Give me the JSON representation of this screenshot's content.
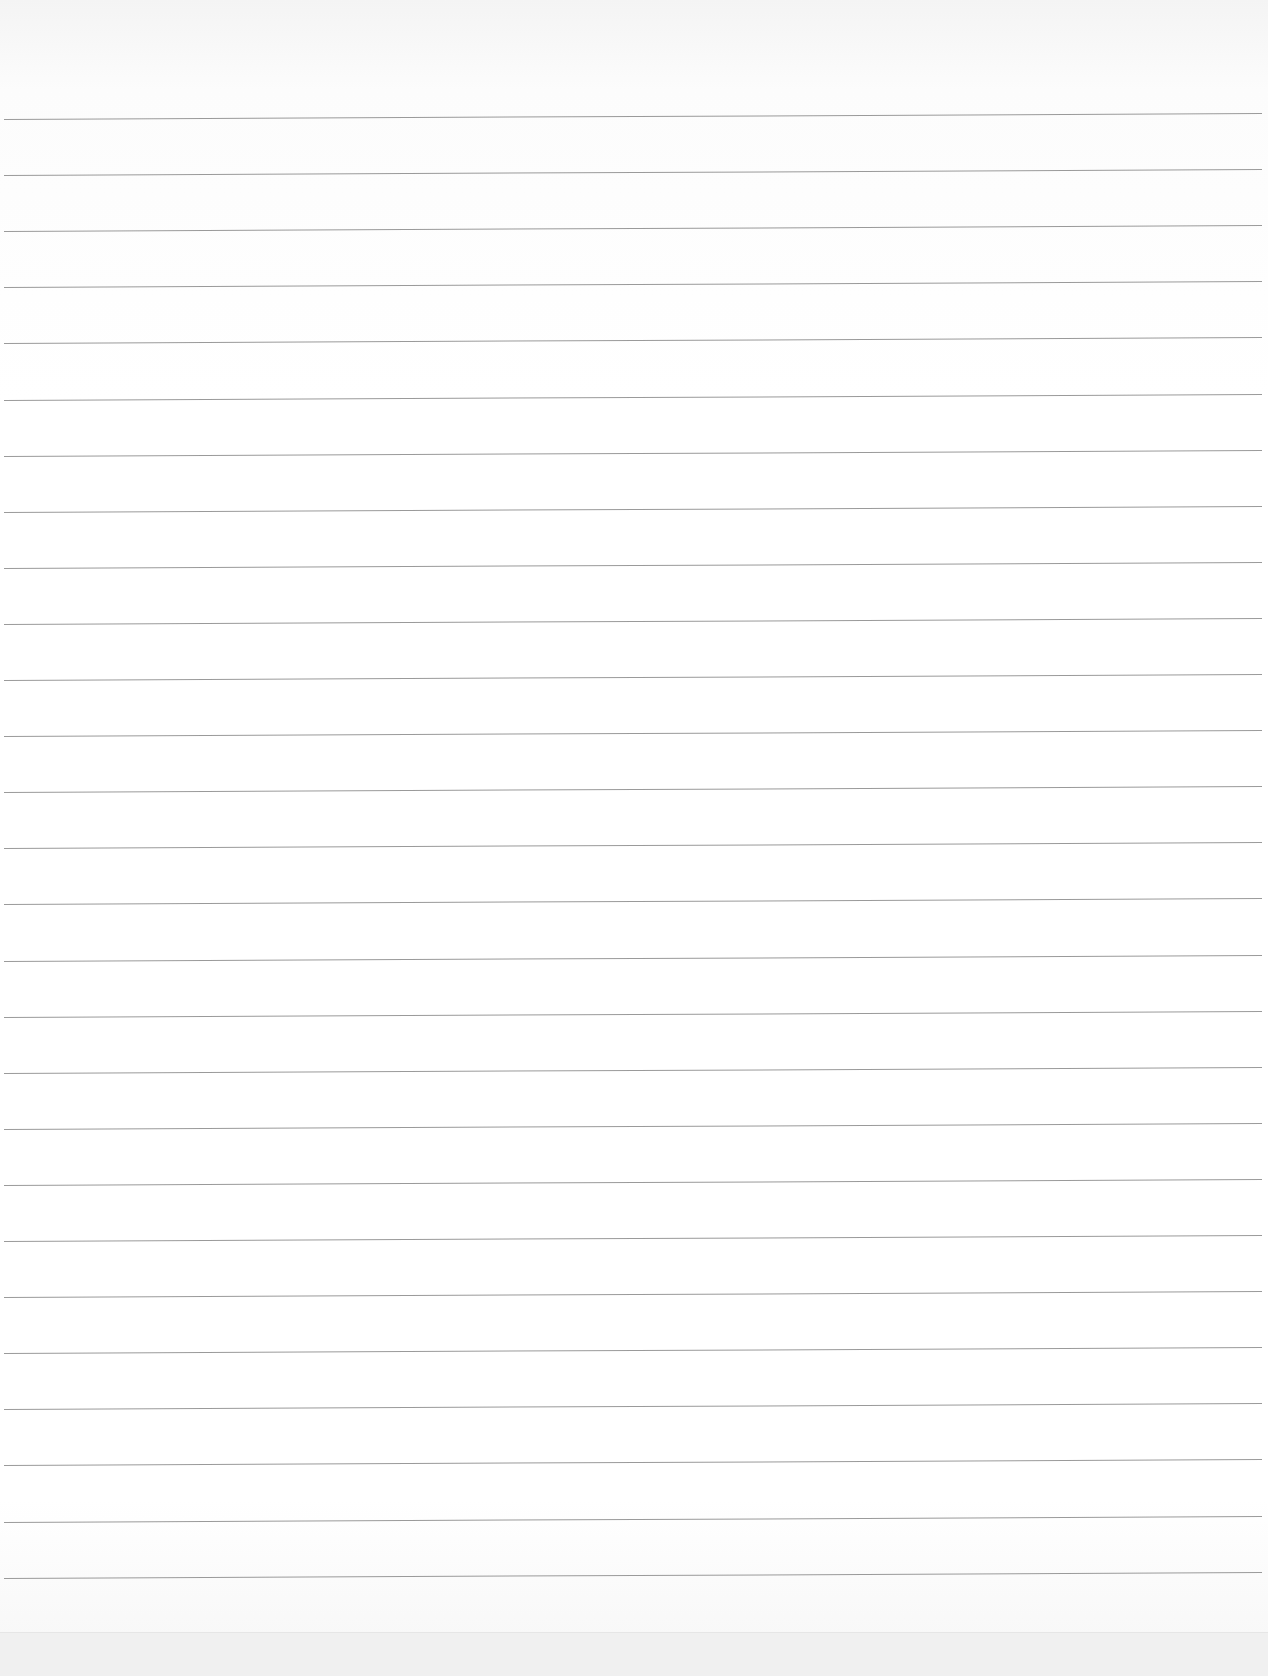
{
  "document": {
    "type": "ruled-paper",
    "text_content": "",
    "rule_count": 27,
    "rule_start_y": 119,
    "rule_spacing": 56.1,
    "colors": {
      "paper": "#ffffff",
      "rule": "#9a9a9a"
    }
  }
}
